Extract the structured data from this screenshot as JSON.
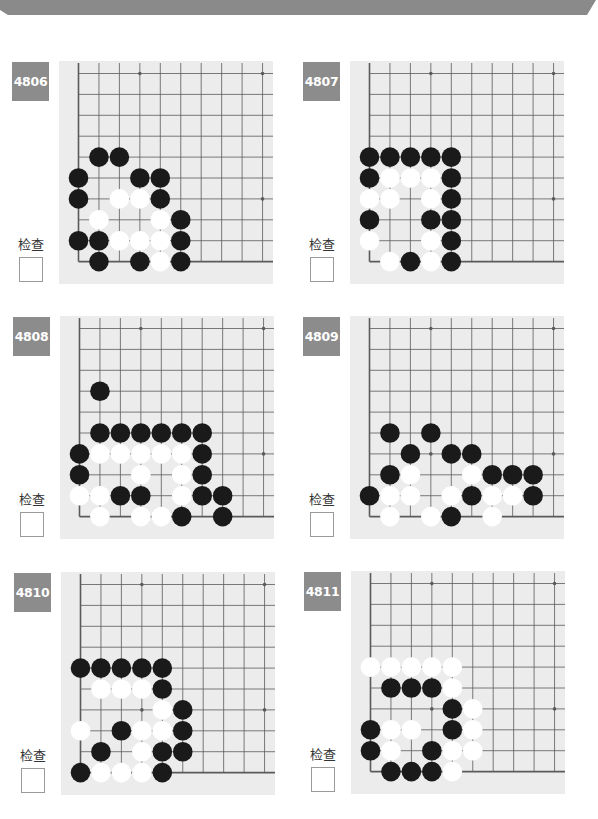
{
  "header": {
    "color": "#8a8a8a"
  },
  "colors": {
    "board_bg": "#ececec",
    "grid_line": "#5a5a5a",
    "black_stone": "#1a1a1a",
    "white_stone": "#ffffff",
    "badge_bg": "#8c8c8c"
  },
  "grid": {
    "cols": 10,
    "rows": 10,
    "star_points": [
      [
        3,
        0
      ],
      [
        9,
        0
      ],
      [
        3,
        6
      ],
      [
        9,
        6
      ]
    ],
    "edges": [
      "left",
      "bottom"
    ]
  },
  "puzzles": [
    {
      "id": "4806",
      "check_label": "检查",
      "pos": {
        "x": 12,
        "y": 61
      },
      "black": [
        [
          1,
          4
        ],
        [
          2,
          4
        ],
        [
          0,
          5
        ],
        [
          3,
          5
        ],
        [
          4,
          5
        ],
        [
          0,
          6
        ],
        [
          4,
          6
        ],
        [
          5,
          7
        ],
        [
          0,
          8
        ],
        [
          1,
          8
        ],
        [
          5,
          8
        ],
        [
          1,
          9
        ],
        [
          3,
          9
        ],
        [
          5,
          9
        ]
      ],
      "white": [
        [
          2,
          6
        ],
        [
          3,
          6
        ],
        [
          1,
          7
        ],
        [
          4,
          7
        ],
        [
          2,
          8
        ],
        [
          3,
          8
        ],
        [
          4,
          8
        ],
        [
          4,
          9
        ]
      ]
    },
    {
      "id": "4807",
      "check_label": "检查",
      "pos": {
        "x": 303,
        "y": 61
      },
      "black": [
        [
          0,
          4
        ],
        [
          1,
          4
        ],
        [
          2,
          4
        ],
        [
          3,
          4
        ],
        [
          4,
          4
        ],
        [
          0,
          5
        ],
        [
          4,
          5
        ],
        [
          4,
          6
        ],
        [
          0,
          7
        ],
        [
          3,
          7
        ],
        [
          4,
          7
        ],
        [
          4,
          8
        ],
        [
          2,
          9
        ],
        [
          4,
          9
        ]
      ],
      "white": [
        [
          1,
          5
        ],
        [
          2,
          5
        ],
        [
          3,
          5
        ],
        [
          0,
          6
        ],
        [
          1,
          6
        ],
        [
          3,
          6
        ],
        [
          0,
          8
        ],
        [
          3,
          8
        ],
        [
          1,
          9
        ],
        [
          3,
          9
        ]
      ]
    },
    {
      "id": "4808",
      "check_label": "检查",
      "pos": {
        "x": 13,
        "y": 316
      },
      "black": [
        [
          1,
          3
        ],
        [
          1,
          5
        ],
        [
          2,
          5
        ],
        [
          3,
          5
        ],
        [
          4,
          5
        ],
        [
          5,
          5
        ],
        [
          6,
          5
        ],
        [
          0,
          6
        ],
        [
          6,
          6
        ],
        [
          0,
          7
        ],
        [
          6,
          7
        ],
        [
          2,
          8
        ],
        [
          3,
          8
        ],
        [
          6,
          8
        ],
        [
          7,
          8
        ],
        [
          5,
          9
        ],
        [
          7,
          9
        ]
      ],
      "white": [
        [
          1,
          6
        ],
        [
          2,
          6
        ],
        [
          3,
          6
        ],
        [
          4,
          6
        ],
        [
          5,
          6
        ],
        [
          3,
          7
        ],
        [
          5,
          7
        ],
        [
          0,
          8
        ],
        [
          1,
          8
        ],
        [
          5,
          8
        ],
        [
          1,
          9
        ],
        [
          3,
          9
        ],
        [
          4,
          9
        ]
      ]
    },
    {
      "id": "4809",
      "check_label": "检查",
      "pos": {
        "x": 303,
        "y": 316
      },
      "black": [
        [
          1,
          5
        ],
        [
          3,
          5
        ],
        [
          2,
          6
        ],
        [
          4,
          6
        ],
        [
          5,
          6
        ],
        [
          1,
          7
        ],
        [
          6,
          7
        ],
        [
          7,
          7
        ],
        [
          8,
          7
        ],
        [
          0,
          8
        ],
        [
          5,
          8
        ],
        [
          8,
          8
        ],
        [
          4,
          9
        ]
      ],
      "white": [
        [
          2,
          7
        ],
        [
          5,
          7
        ],
        [
          1,
          8
        ],
        [
          2,
          8
        ],
        [
          4,
          8
        ],
        [
          6,
          8
        ],
        [
          7,
          8
        ],
        [
          1,
          9
        ],
        [
          3,
          9
        ],
        [
          6,
          9
        ]
      ]
    },
    {
      "id": "4810",
      "check_label": "检查",
      "pos": {
        "x": 14,
        "y": 572
      },
      "black": [
        [
          0,
          4
        ],
        [
          1,
          4
        ],
        [
          2,
          4
        ],
        [
          3,
          4
        ],
        [
          4,
          4
        ],
        [
          4,
          5
        ],
        [
          5,
          6
        ],
        [
          2,
          7
        ],
        [
          5,
          7
        ],
        [
          1,
          8
        ],
        [
          4,
          8
        ],
        [
          5,
          8
        ],
        [
          0,
          9
        ],
        [
          4,
          9
        ]
      ],
      "white": [
        [
          1,
          5
        ],
        [
          2,
          5
        ],
        [
          3,
          5
        ],
        [
          4,
          6
        ],
        [
          0,
          7
        ],
        [
          3,
          7
        ],
        [
          4,
          7
        ],
        [
          3,
          8
        ],
        [
          1,
          9
        ],
        [
          2,
          9
        ],
        [
          3,
          9
        ]
      ]
    },
    {
      "id": "4811",
      "check_label": "检查",
      "pos": {
        "x": 304,
        "y": 571
      },
      "black": [
        [
          1,
          5
        ],
        [
          2,
          5
        ],
        [
          3,
          5
        ],
        [
          4,
          6
        ],
        [
          0,
          7
        ],
        [
          4,
          7
        ],
        [
          0,
          8
        ],
        [
          3,
          8
        ],
        [
          1,
          9
        ],
        [
          2,
          9
        ],
        [
          3,
          9
        ]
      ],
      "white": [
        [
          0,
          4
        ],
        [
          1,
          4
        ],
        [
          2,
          4
        ],
        [
          3,
          4
        ],
        [
          4,
          4
        ],
        [
          4,
          5
        ],
        [
          5,
          6
        ],
        [
          1,
          7
        ],
        [
          2,
          7
        ],
        [
          5,
          7
        ],
        [
          1,
          8
        ],
        [
          4,
          8
        ],
        [
          5,
          8
        ],
        [
          4,
          9
        ]
      ]
    }
  ]
}
